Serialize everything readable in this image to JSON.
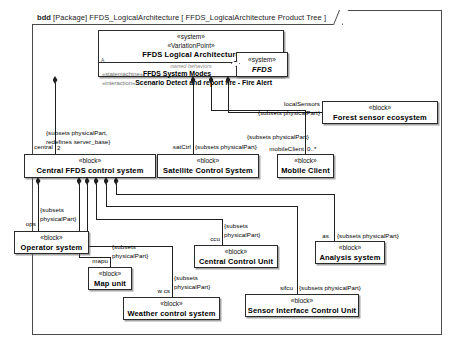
{
  "frame": {
    "kind": "bdd",
    "package_kw": "[Package]",
    "package_name": "FFDS_LogicalArchitecture",
    "diagram_name": "[ FFDS_LogicalArchitecture Product Tree ]"
  },
  "blocks": {
    "root": {
      "stereotype1": "«system»",
      "stereotype2": "«VariationPoint»",
      "name": "FFDS Logical Architecture",
      "compartment_label": "owned behaviors",
      "behavior1_stereotype": "«statemachine»",
      "behavior1_name": "FFDS System Modes",
      "behavior2_stereotype": "«interaction»",
      "behavior2_name": "Scenario Detect and report fire - Fire Alert",
      "marker": "A"
    },
    "ffds": {
      "stereotype": "«system»",
      "name": "FFDS"
    },
    "forest": {
      "stereotype": "«block»",
      "name": "Forest sensor ecosystem"
    },
    "central": {
      "stereotype": "«block»",
      "name": "Central FFDS control system"
    },
    "sat": {
      "stereotype": "«block»",
      "name": "Satellite Control System"
    },
    "mobile": {
      "stereotype": "«block»",
      "name": "Mobile Client"
    },
    "oper": {
      "stereotype": "«block»",
      "name": "Operator system"
    },
    "map": {
      "stereotype": "«block»",
      "name": "Map unit"
    },
    "ccu": {
      "stereotype": "«block»",
      "name": "Central Control Unit"
    },
    "anal": {
      "stereotype": "«block»",
      "name": "Analysis system"
    },
    "weather": {
      "stereotype": "«block»",
      "name": "Weather control system"
    },
    "sensor": {
      "stereotype": "«block»",
      "name": "Sensor Interface Control Unit"
    }
  },
  "edges": {
    "local_sensors_role": "localSensors",
    "local_sensors_constraint": "{subsets physicalPart}",
    "mobile_constraint": "{subsets physicalPart}",
    "mobile_role": "mobileClient",
    "mobile_mult": "0..*",
    "central_role": "central",
    "central_mult": "2",
    "central_constraint_1": "{subsets physicalPart,",
    "central_constraint_2": "redefines server_base}",
    "sat_role": "satCtrl",
    "sat_constraint": "{subsets physicalPart}",
    "ops_role": "ops",
    "ops_constraint_1": "{subsets",
    "ops_constraint_2": "physicalPart}",
    "mapu_role": "mapu",
    "mapu_constraint_1": "{subsets",
    "mapu_constraint_2": "physicalPart}",
    "ccu_role": "ccu",
    "ccu_constraint_1": "{subsets",
    "ccu_constraint_2": "physicalPart}",
    "as_role": "as",
    "as_constraint": "{subsets physicalPart}",
    "wcs_role": "w cs",
    "wcs_constraint_1": "{subsets",
    "wcs_constraint_2": "physicalPart}",
    "sifcu_role": "sifcu",
    "sifcu_constraint": "{subsets physicalPart}"
  },
  "colors": {
    "stroke": "#2b2b2b",
    "background": "#ffffff",
    "compartment_label": "#8a8a8a"
  }
}
